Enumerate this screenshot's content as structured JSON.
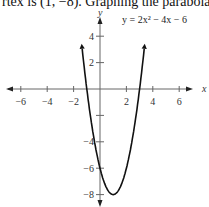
{
  "header": {
    "text": "rtex is (1, −8). Graphing the parabola:"
  },
  "chart_data": {
    "type": "line",
    "title": "",
    "equation_label": "y = 2x² − 4x − 6",
    "xlabel": "x",
    "ylabel": "y",
    "xlim": [
      -7.5,
      8
    ],
    "ylim": [
      -9,
      6.5
    ],
    "x_ticks": [
      -6,
      -4,
      -2,
      2,
      4,
      6
    ],
    "y_ticks": [
      4,
      2,
      -4,
      -6,
      -8
    ],
    "x_tick_labels": [
      "−6",
      "−4",
      "−2",
      "2",
      "4",
      "6"
    ],
    "y_tick_labels": [
      "4",
      "2",
      "−4",
      "−6",
      "−8"
    ],
    "grid": false,
    "series": [
      {
        "name": "y = 2x² − 4x − 6",
        "function": "2x^2-4x-6",
        "vertex": [
          1,
          -8
        ],
        "x_range": [
          -1.35,
          3.35
        ]
      }
    ]
  }
}
